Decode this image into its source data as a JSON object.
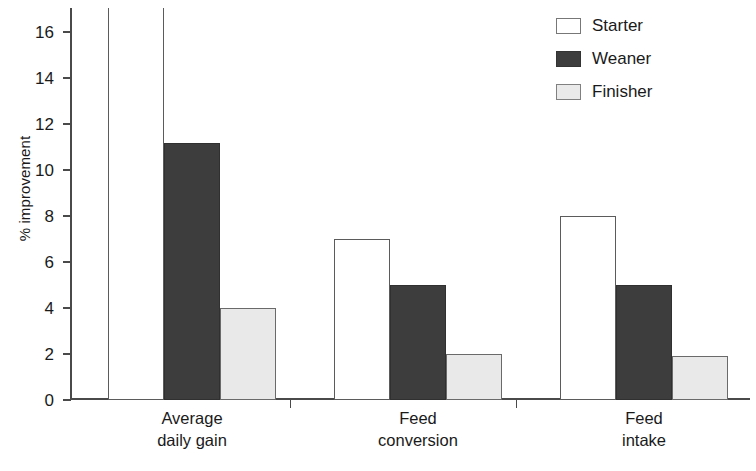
{
  "chart_data": {
    "type": "bar",
    "title": "",
    "subtitle": "",
    "xlabel": "",
    "ylabel": "% improvement",
    "ylim": [
      0,
      17.05
    ],
    "yticks": [
      0,
      2,
      4,
      6,
      8,
      10,
      12,
      14,
      16
    ],
    "ytick_labels": [
      "0",
      "2",
      "4",
      "6",
      "8",
      "10",
      "12",
      "14",
      "16"
    ],
    "grid": false,
    "legend_position": "top-right",
    "clipped_note": "first Starter bar extends above the top of the axis",
    "categories": [
      "Average daily gain",
      "Feed conversion",
      "Feed intake"
    ],
    "category_lines": [
      [
        "Average",
        "daily gain"
      ],
      [
        "Feed",
        "conversion"
      ],
      [
        "Feed",
        "intake"
      ]
    ],
    "series": [
      {
        "name": "Starter",
        "color": "#ffffff",
        "edge": "#5b5b5b",
        "values": [
          17.05,
          7.0,
          8.0
        ]
      },
      {
        "name": "Weaner",
        "color": "#3d3d3d",
        "edge": "#303030",
        "values": [
          11.2,
          5.0,
          5.0
        ]
      },
      {
        "name": "Finisher",
        "color": "#e9e9e9",
        "edge": "#6a6a6a",
        "values": [
          4.0,
          2.0,
          1.9
        ]
      }
    ]
  },
  "legend": {
    "items": [
      {
        "label": "Starter"
      },
      {
        "label": "Weaner"
      },
      {
        "label": "Finisher"
      }
    ]
  }
}
